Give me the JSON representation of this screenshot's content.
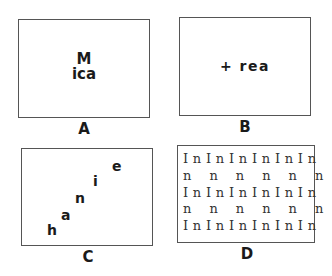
{
  "panels": [
    {
      "id": "A",
      "label": "A",
      "lines": [
        "M",
        "ica"
      ]
    },
    {
      "id": "B",
      "label": "B",
      "text": "+ rea"
    },
    {
      "id": "C",
      "label": "C",
      "letters": [
        {
          "char": "h",
          "x": 25,
          "y": 76
        },
        {
          "char": "a",
          "x": 39,
          "y": 61
        },
        {
          "char": "n",
          "x": 53,
          "y": 43
        },
        {
          "char": "i",
          "x": 71,
          "y": 26
        },
        {
          "char": "e",
          "x": 90,
          "y": 11
        }
      ]
    },
    {
      "id": "D",
      "label": "D",
      "rows": [
        "I n I n I n I n I n I n",
        "n    n    n    n    n    n",
        "I n I n I n I n I n I n",
        "n    n    n    n    n    n",
        "I n I n I n I n I n I n"
      ]
    }
  ]
}
